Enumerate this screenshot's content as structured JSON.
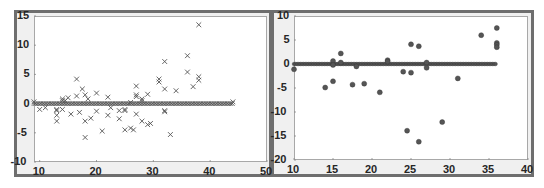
{
  "chart_data": [
    {
      "type": "scatter",
      "title": "",
      "xlabel": "",
      "ylabel": "",
      "xlim": [
        9,
        50
      ],
      "ylim": [
        -10,
        15
      ],
      "xticks": [
        10,
        20,
        30,
        40,
        50
      ],
      "yticks": [
        -10,
        -5,
        0,
        5,
        10,
        15
      ],
      "marker": "x",
      "marker_color": "#555555",
      "grid": false,
      "baseline": {
        "y": 0,
        "x_from": 9,
        "x_to": 44,
        "dense_markers": true
      },
      "points": [
        [
          9,
          0.3
        ],
        [
          10,
          -1
        ],
        [
          11,
          -0.7
        ],
        [
          13,
          -1
        ],
        [
          13,
          -1.2
        ],
        [
          13,
          -2
        ],
        [
          13,
          -3
        ],
        [
          14,
          0.8
        ],
        [
          14,
          -1
        ],
        [
          14,
          0.5
        ],
        [
          14.5,
          0.5
        ],
        [
          15,
          1
        ],
        [
          15.5,
          -1.8
        ],
        [
          16.5,
          4.2
        ],
        [
          16.5,
          1.3
        ],
        [
          17,
          -1.5
        ],
        [
          17.5,
          2.5
        ],
        [
          18,
          1.5
        ],
        [
          18,
          -3
        ],
        [
          18,
          -5.8
        ],
        [
          18.5,
          0.8
        ],
        [
          19,
          -2.5
        ],
        [
          20,
          1.8
        ],
        [
          20,
          -1.3
        ],
        [
          21,
          -4.7
        ],
        [
          22,
          1.1
        ],
        [
          22,
          -2
        ],
        [
          22.5,
          -0.7
        ],
        [
          24,
          -1.2
        ],
        [
          24,
          -2.6
        ],
        [
          25,
          -1
        ],
        [
          25,
          -1.2
        ],
        [
          25,
          -4.5
        ],
        [
          26,
          0.2
        ],
        [
          26,
          -4.2
        ],
        [
          26.5,
          -4.5
        ],
        [
          27,
          3
        ],
        [
          27,
          1.5
        ],
        [
          27,
          1.2
        ],
        [
          27,
          -1.8
        ],
        [
          28,
          0.8
        ],
        [
          28,
          -3
        ],
        [
          28,
          0.5
        ],
        [
          29,
          1.6
        ],
        [
          29,
          -3.6
        ],
        [
          29.5,
          -3.4
        ],
        [
          31,
          4.2
        ],
        [
          31,
          3.7
        ],
        [
          32,
          7.2
        ],
        [
          32,
          2.5
        ],
        [
          32,
          -1.2
        ],
        [
          32,
          -1.4
        ],
        [
          33,
          -5.3
        ],
        [
          34,
          2.2
        ],
        [
          36,
          8.2
        ],
        [
          36,
          5.4
        ],
        [
          37,
          2.9
        ],
        [
          38,
          13.5
        ],
        [
          38,
          4.6
        ],
        [
          38,
          4
        ],
        [
          44,
          0.3
        ]
      ]
    },
    {
      "type": "scatter",
      "title": "",
      "xlabel": "",
      "ylabel": "",
      "xlim": [
        10,
        40
      ],
      "ylim": [
        -20,
        10
      ],
      "xticks": [
        10,
        15,
        20,
        25,
        30,
        35,
        40
      ],
      "yticks": [
        -20,
        -15,
        -10,
        -5,
        0,
        5,
        10
      ],
      "marker": "filled-circle",
      "marker_color": "#555555",
      "grid": false,
      "baseline": {
        "y": 0,
        "x_from": 10,
        "x_to": 36,
        "dense_markers": true
      },
      "points": [
        [
          10,
          -1.1
        ],
        [
          14,
          -4.9
        ],
        [
          15,
          0.6
        ],
        [
          15,
          -0.2
        ],
        [
          15,
          -3.6
        ],
        [
          16,
          2.2
        ],
        [
          16,
          0.3
        ],
        [
          17.5,
          -4.3
        ],
        [
          18,
          -0.5
        ],
        [
          19,
          -4.1
        ],
        [
          21,
          -5.9
        ],
        [
          22,
          0.8
        ],
        [
          22,
          0.5
        ],
        [
          24,
          -1.6
        ],
        [
          24.5,
          -13.9
        ],
        [
          25,
          4.1
        ],
        [
          25,
          -1.8
        ],
        [
          26,
          3.7
        ],
        [
          26,
          -16.2
        ],
        [
          27,
          0.3
        ],
        [
          27,
          -0.8
        ],
        [
          29,
          -12.1
        ],
        [
          31,
          -3
        ],
        [
          34,
          6
        ],
        [
          36,
          7.5
        ],
        [
          36,
          4.4
        ],
        [
          36,
          4
        ],
        [
          36,
          3.5
        ]
      ]
    }
  ]
}
